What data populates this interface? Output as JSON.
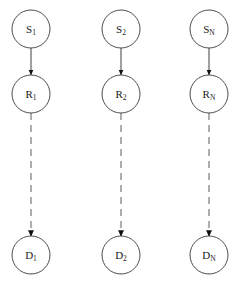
{
  "figure": {
    "title": "",
    "background_color": "#ffffff",
    "width": 241,
    "height": 281
  },
  "style": {
    "node_stroke_color": "#3a3a3a",
    "node_fill_color": "#ffffff",
    "node_stroke_width": 0.9,
    "node_radius": 19,
    "solid_edge_color": "#2b2b2b",
    "solid_edge_width": 0.9,
    "dashed_edge_color": "#a6a6a6",
    "dashed_edge_width": 1.8,
    "dash_pattern": "7 5",
    "arrowhead_color": "#111111",
    "label_color": "#1a1a1a"
  },
  "chains": [
    {
      "id": "chain-1",
      "center_x": 31,
      "nodes": [
        {
          "id": "node-s1",
          "role": "source",
          "base": "S",
          "subscript": "1",
          "label": "S1",
          "cx": 31,
          "cy": 29
        },
        {
          "id": "node-r1",
          "role": "relay",
          "base": "R",
          "subscript": "1",
          "label": "R1",
          "cx": 31,
          "cy": 94
        },
        {
          "id": "node-d1",
          "role": "destination",
          "base": "D",
          "subscript": "1",
          "label": "D1",
          "cx": 31,
          "cy": 255
        }
      ],
      "edges": [
        {
          "id": "edge-s1-r1",
          "from": "node-s1",
          "to": "node-r1",
          "style": "solid",
          "arrow": true,
          "x": 31,
          "y1": 48,
          "y2": 75
        },
        {
          "id": "edge-r1-d1",
          "from": "node-r1",
          "to": "node-d1",
          "style": "dashed",
          "arrow": true,
          "x": 31,
          "y1": 113,
          "y2": 236
        }
      ]
    },
    {
      "id": "chain-2",
      "center_x": 121,
      "nodes": [
        {
          "id": "node-s2",
          "role": "source",
          "base": "S",
          "subscript": "2",
          "label": "S2",
          "cx": 121,
          "cy": 29
        },
        {
          "id": "node-r2",
          "role": "relay",
          "base": "R",
          "subscript": "2",
          "label": "R2",
          "cx": 121,
          "cy": 94
        },
        {
          "id": "node-d2",
          "role": "destination",
          "base": "D",
          "subscript": "2",
          "label": "D2",
          "cx": 121,
          "cy": 255
        }
      ],
      "edges": [
        {
          "id": "edge-s2-r2",
          "from": "node-s2",
          "to": "node-r2",
          "style": "solid",
          "arrow": true,
          "x": 121,
          "y1": 48,
          "y2": 75
        },
        {
          "id": "edge-r2-d2",
          "from": "node-r2",
          "to": "node-d2",
          "style": "dashed",
          "arrow": true,
          "x": 121,
          "y1": 113,
          "y2": 236
        }
      ]
    },
    {
      "id": "chain-n",
      "center_x": 209,
      "nodes": [
        {
          "id": "node-sn",
          "role": "source",
          "base": "S",
          "subscript": "N",
          "label": "SN",
          "cx": 209,
          "cy": 29
        },
        {
          "id": "node-rn",
          "role": "relay",
          "base": "R",
          "subscript": "N",
          "label": "RN",
          "cx": 209,
          "cy": 94
        },
        {
          "id": "node-dn",
          "role": "destination",
          "base": "D",
          "subscript": "N",
          "label": "DN",
          "cx": 209,
          "cy": 255
        }
      ],
      "edges": [
        {
          "id": "edge-sn-rn",
          "from": "node-sn",
          "to": "node-rn",
          "style": "solid",
          "arrow": true,
          "x": 209,
          "y1": 48,
          "y2": 75
        },
        {
          "id": "edge-rn-dn",
          "from": "node-rn",
          "to": "node-dn",
          "style": "dashed",
          "arrow": true,
          "x": 209,
          "y1": 113,
          "y2": 236
        }
      ]
    }
  ]
}
